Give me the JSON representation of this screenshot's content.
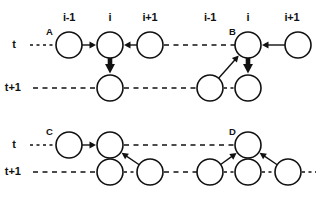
{
  "figure": {
    "title": "",
    "column_labels": [
      {
        "text": "i-1",
        "x": 69,
        "y": 18
      },
      {
        "text": "i",
        "x": 110,
        "y": 18
      },
      {
        "text": "i+1",
        "x": 150,
        "y": 18
      },
      {
        "text": "i-1",
        "x": 210,
        "y": 18
      },
      {
        "text": "i",
        "x": 248,
        "y": 18
      },
      {
        "text": "i+1",
        "x": 292,
        "y": 18
      }
    ],
    "row_labels": [
      {
        "text": "t",
        "x": 16,
        "y": 45
      },
      {
        "text": "t+1",
        "x": 21,
        "y": 88
      },
      {
        "text": "t",
        "x": 16,
        "y": 145
      },
      {
        "text": "t+1",
        "x": 21,
        "y": 172
      }
    ],
    "panel_labels": [
      {
        "text": "A",
        "x": 46,
        "y": 33
      },
      {
        "text": "B",
        "x": 229,
        "y": 33
      },
      {
        "text": "C",
        "x": 46,
        "y": 133
      },
      {
        "text": "D",
        "x": 229,
        "y": 133
      }
    ],
    "colors": {
      "ink": "#111111",
      "paper": "#ffffff",
      "node_fill": "#ffffff"
    },
    "node_radius": 13,
    "panels": {
      "A": {
        "label": "A",
        "nodes_t": [
          {
            "id": "A-t-im1",
            "x": 69,
            "y": 45
          },
          {
            "id": "A-t-i",
            "x": 110,
            "y": 45
          },
          {
            "id": "A-t-ip1",
            "x": 150,
            "y": 45
          }
        ],
        "nodes_t1": [
          {
            "id": "A-t1-i",
            "x": 110,
            "y": 88
          }
        ],
        "edges": [
          {
            "from": "A-t-im1",
            "to": "A-t-i",
            "style": "thin"
          },
          {
            "from": "A-t-ip1",
            "to": "A-t-i",
            "style": "thin"
          },
          {
            "from": "A-t-i",
            "to": "A-t1-i",
            "style": "thick"
          }
        ]
      },
      "B": {
        "label": "B",
        "nodes_t": [
          {
            "id": "B-t-i",
            "x": 248,
            "y": 45
          },
          {
            "id": "B-t-ip1",
            "x": 298,
            "y": 45
          }
        ],
        "nodes_t1": [
          {
            "id": "B-t1-im1",
            "x": 210,
            "y": 88
          },
          {
            "id": "B-t1-i",
            "x": 248,
            "y": 88
          }
        ],
        "edges": [
          {
            "from": "B-t-ip1",
            "to": "B-t-i",
            "style": "thin"
          },
          {
            "from": "B-t1-im1",
            "to": "B-t-i",
            "style": "thin"
          },
          {
            "from": "B-t-i",
            "to": "B-t1-i",
            "style": "thick"
          }
        ]
      },
      "C": {
        "label": "C",
        "nodes_t": [
          {
            "id": "C-t-im1",
            "x": 69,
            "y": 145
          },
          {
            "id": "C-t-i",
            "x": 110,
            "y": 145
          }
        ],
        "nodes_t1": [
          {
            "id": "C-t1-i",
            "x": 110,
            "y": 172
          },
          {
            "id": "C-t1-ip1",
            "x": 150,
            "y": 172
          }
        ],
        "edges": [
          {
            "from": "C-t-im1",
            "to": "C-t-i",
            "style": "thin"
          },
          {
            "from": "C-t1-ip1",
            "to": "C-t-i",
            "style": "thin"
          },
          {
            "from": "C-t-i",
            "to": "C-t1-i",
            "style": "thick"
          }
        ]
      },
      "D": {
        "label": "D",
        "nodes_t": [
          {
            "id": "D-t-i",
            "x": 248,
            "y": 145
          }
        ],
        "nodes_t1": [
          {
            "id": "D-t1-im1",
            "x": 210,
            "y": 172
          },
          {
            "id": "D-t1-i",
            "x": 248,
            "y": 172
          },
          {
            "id": "D-t1-ip1",
            "x": 288,
            "y": 172
          }
        ],
        "edges": [
          {
            "from": "D-t1-im1",
            "to": "D-t-i",
            "style": "thin"
          },
          {
            "from": "D-t1-ip1",
            "to": "D-t-i",
            "style": "thin"
          },
          {
            "from": "D-t-i",
            "to": "D-t1-i",
            "style": "thick"
          }
        ]
      }
    },
    "lattice_lines": [
      {
        "id": "row-t-top-left",
        "x1": 30,
        "y1": 45,
        "x2": 56,
        "y2": 45
      },
      {
        "id": "row-t-top-mid",
        "x1": 164,
        "y1": 45,
        "x2": 235,
        "y2": 45
      },
      {
        "id": "row-t1-top-left",
        "x1": 33,
        "y1": 88,
        "x2": 97,
        "y2": 88
      },
      {
        "id": "row-t1-top-mid",
        "x1": 124,
        "y1": 88,
        "x2": 197,
        "y2": 88
      },
      {
        "id": "row-t1-top-gap",
        "x1": 224,
        "y1": 88,
        "x2": 235,
        "y2": 88
      },
      {
        "id": "row-t-bot-left",
        "x1": 30,
        "y1": 145,
        "x2": 56,
        "y2": 145
      },
      {
        "id": "row-t-bot-mid",
        "x1": 124,
        "y1": 145,
        "x2": 235,
        "y2": 145
      },
      {
        "id": "row-t1-bot-left",
        "x1": 33,
        "y1": 172,
        "x2": 97,
        "y2": 172
      },
      {
        "id": "row-t1-bot-mid",
        "x1": 124,
        "y1": 172,
        "x2": 137,
        "y2": 172
      },
      {
        "id": "row-t1-bot-mid2",
        "x1": 164,
        "y1": 172,
        "x2": 197,
        "y2": 172
      },
      {
        "id": "row-t1-bot-mid3",
        "x1": 224,
        "y1": 172,
        "x2": 235,
        "y2": 172
      },
      {
        "id": "row-t1-bot-right",
        "x1": 262,
        "y1": 172,
        "x2": 275,
        "y2": 172
      },
      {
        "id": "row-t1-bot-end",
        "x1": 302,
        "y1": 172,
        "x2": 316,
        "y2": 172
      }
    ]
  }
}
